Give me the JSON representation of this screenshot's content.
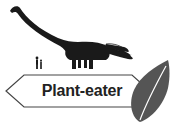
{
  "label": {
    "text": "Plant-eater"
  },
  "icons": {
    "dinosaur": "sauropod-silhouette",
    "human": "human-scale-silhouette",
    "leaf": "leaf"
  },
  "colors": {
    "silhouette": "#1a1a1a",
    "leaf": "#555555",
    "leaf_vein": "#ffffff",
    "label_border": "#444444",
    "label_text": "#222222",
    "background": "#ffffff"
  }
}
